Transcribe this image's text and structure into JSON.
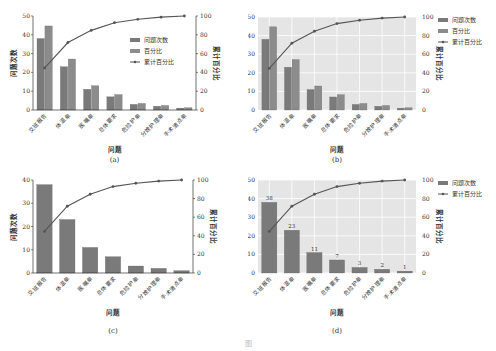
{
  "figure": {
    "caption": "图"
  },
  "colors": {
    "bar": "#7a7a7a",
    "bar_percent": "#8c8c8c",
    "line": "#555555",
    "axes_bg_styled": "#e5e5e5",
    "grid_styled": "#ffffff"
  },
  "chart_data": [
    {
      "panel": "(a)",
      "type": "bar",
      "style": "classic",
      "categories": [
        "交班报告",
        "体温单",
        "医嘱单",
        "总体要求",
        "危险护单",
        "分娩护理单",
        "手术清点单"
      ],
      "series": [
        {
          "name": "问题次数",
          "type": "bar",
          "axis": "left",
          "values": [
            38,
            23,
            11,
            7,
            3,
            2,
            1
          ]
        },
        {
          "name": "百分比",
          "type": "bar",
          "axis": "left",
          "values": [
            44.7,
            27.1,
            12.9,
            8.2,
            3.5,
            2.4,
            1.2
          ]
        },
        {
          "name": "累计百分比",
          "type": "line",
          "axis": "right",
          "values": [
            44.7,
            71.8,
            84.7,
            92.9,
            96.5,
            98.8,
            100
          ]
        }
      ],
      "xlabel": "问题",
      "ylabel": "问题次数",
      "ylabel_right": "累计百分比",
      "ylim": [
        0,
        50
      ],
      "yticks": [
        0,
        10,
        20,
        30,
        40,
        50
      ],
      "ylim_right": [
        0,
        100
      ],
      "yticks_right": [
        0,
        20,
        40,
        60,
        80,
        100
      ],
      "legend": [
        "问题次数",
        "百分比",
        "累计百分比"
      ],
      "legend_position": "inside-right",
      "grid": false,
      "data_labels": false
    },
    {
      "panel": "(b)",
      "type": "bar",
      "style": "seaborn-gray",
      "categories": [
        "交班报告",
        "体温单",
        "医嘱单",
        "总体要求",
        "危险护单",
        "分娩护理单",
        "手术清点单"
      ],
      "series": [
        {
          "name": "问题次数",
          "type": "bar",
          "axis": "left",
          "values": [
            38,
            23,
            11,
            7,
            3,
            2,
            1
          ]
        },
        {
          "name": "百分比",
          "type": "bar",
          "axis": "left",
          "values": [
            44.7,
            27.1,
            12.9,
            8.2,
            3.5,
            2.4,
            1.2
          ]
        },
        {
          "name": "累计百分比",
          "type": "line",
          "axis": "right",
          "values": [
            44.7,
            71.8,
            84.7,
            92.9,
            96.5,
            98.8,
            100
          ]
        }
      ],
      "xlabel": "问题",
      "ylabel": "问题次数",
      "ylabel_right": "累计百分比",
      "ylim": [
        0,
        50
      ],
      "yticks": [
        0,
        10,
        20,
        30,
        40,
        50
      ],
      "ylim_right": [
        0,
        100
      ],
      "yticks_right": [
        0,
        20,
        40,
        60,
        80,
        100
      ],
      "legend": [
        "问题次数",
        "百分比",
        "累计百分比"
      ],
      "legend_position": "outside-right",
      "grid": true,
      "data_labels": false
    },
    {
      "panel": "(c)",
      "type": "bar",
      "style": "classic",
      "categories": [
        "交班报告",
        "体温单",
        "医嘱单",
        "总体要求",
        "危险护单",
        "分娩护理单",
        "手术清点单"
      ],
      "series": [
        {
          "name": "问题次数",
          "type": "bar",
          "axis": "left",
          "values": [
            38,
            23,
            11,
            7,
            3,
            2,
            1
          ]
        },
        {
          "name": "累计百分比",
          "type": "line",
          "axis": "right",
          "values": [
            44.7,
            71.8,
            84.7,
            92.9,
            96.5,
            98.8,
            100
          ]
        }
      ],
      "xlabel": "问题",
      "ylabel": "问题次数",
      "ylabel_right": "累计百分比",
      "ylim": [
        0,
        40
      ],
      "yticks": [
        0,
        10,
        20,
        30,
        40
      ],
      "ylim_right": [
        0,
        100
      ],
      "yticks_right": [
        0,
        20,
        40,
        60,
        80,
        100
      ],
      "legend": [],
      "legend_position": "none",
      "grid": false,
      "data_labels": false
    },
    {
      "panel": "(d)",
      "type": "bar",
      "style": "seaborn-gray",
      "categories": [
        "交班报告",
        "体温单",
        "医嘱单",
        "总体要求",
        "危险护单",
        "分娩护理单",
        "手术清点单"
      ],
      "series": [
        {
          "name": "问题次数",
          "type": "bar",
          "axis": "left",
          "values": [
            38,
            23,
            11,
            7,
            3,
            2,
            1
          ]
        },
        {
          "name": "累计百分比",
          "type": "line",
          "axis": "right",
          "values": [
            44.7,
            71.8,
            84.7,
            92.9,
            96.5,
            98.8,
            100
          ]
        }
      ],
      "xlabel": "问题",
      "ylabel": "问题次数",
      "ylabel_right": "累计百分比",
      "ylim": [
        0,
        50
      ],
      "yticks": [
        0,
        10,
        20,
        30,
        40,
        50
      ],
      "ylim_right": [
        0,
        100
      ],
      "yticks_right": [
        0,
        20,
        40,
        60,
        80,
        100
      ],
      "legend": [
        "问题次数",
        "累计百分比"
      ],
      "legend_position": "outside-right",
      "grid": true,
      "data_labels": true
    }
  ]
}
